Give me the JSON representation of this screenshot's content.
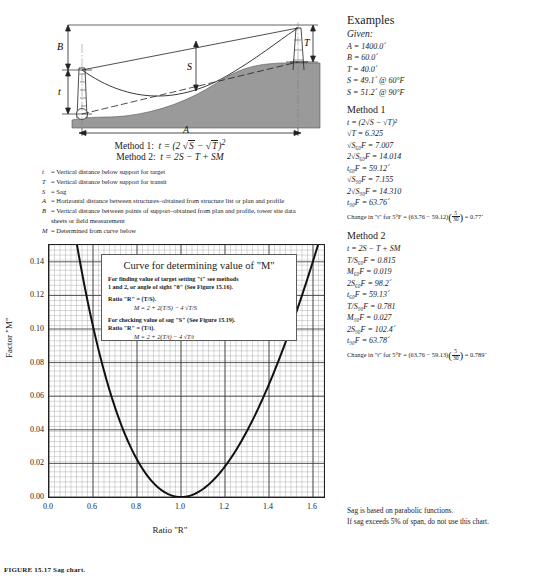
{
  "diagram": {
    "labels": {
      "B": "B",
      "T": "T",
      "S": "S",
      "t": "t",
      "A": "A"
    },
    "method1": "Method 1:  t = (2 √S − √T)²",
    "method2": "Method 2:  t = 2S − T + SM",
    "method1_label": "Method 1:",
    "method2_label": "Method 2:"
  },
  "definitions": [
    {
      "sym": "t",
      "text": "= Vertical distance below support for target"
    },
    {
      "sym": "T",
      "text": "= Vertical distance below support for transit"
    },
    {
      "sym": "S",
      "text": "= Sag"
    },
    {
      "sym": "A",
      "text": "= Horizontal distance between structures–obtained from structure list or plan and profile"
    },
    {
      "sym": "B",
      "text": "= Vertical distance between points of support–obtained from plan and profile, tower site data"
    },
    {
      "sym": "",
      "text": "sheets or field measurement"
    },
    {
      "sym": "M",
      "text": "= Determined from curve below"
    }
  ],
  "curve_box": {
    "title": "Curve for determining value of \"M\"",
    "line1": "For finding value of target setting \"t\" see methods",
    "line2": "1 and 2, or angle of sight \"θ\" (See Figure 15.16).",
    "ratio1": "Ratio \"R\" = (T/S).",
    "formula1": "M = 2 + 2(T/S) − 4 √T/S",
    "line3": "For checking value of sag \"S\"  (See Figure 15.19).",
    "ratio2": "Ratio \"R\" = (T/t).",
    "formula2": "M = 2 + 2(T/t) − 4 √T/t"
  },
  "chart_data": {
    "type": "line",
    "title": "Curve for determining value of \"M\"",
    "xlabel": "Ratio \"R\"",
    "ylabel": "Factor \"M\"",
    "xlim": [
      0.4,
      1.65
    ],
    "ylim": [
      0.0,
      0.15
    ],
    "xticks": [
      0.4,
      0.6,
      0.8,
      1.0,
      1.2,
      1.4,
      1.6
    ],
    "xticklabels": [
      "0.0",
      "0.6",
      "0.8",
      "1.0",
      "1.2",
      "1.4",
      "1.6"
    ],
    "yticks": [
      0.0,
      0.02,
      0.04,
      0.06,
      0.08,
      0.1,
      0.12,
      0.14
    ],
    "yticklabels": [
      "0.00",
      "0.02",
      "0.04",
      "0.06",
      "0.08",
      "0.10",
      "0.12",
      "0.14"
    ],
    "grid": true,
    "equation": "M = 2 + 2R - 4*sqrt(R)",
    "series": [
      {
        "name": "Factor M",
        "x": [
          0.45,
          0.5,
          0.55,
          0.6,
          0.65,
          0.7,
          0.75,
          0.8,
          0.85,
          0.9,
          0.95,
          1.0,
          1.05,
          1.1,
          1.15,
          1.2,
          1.25,
          1.3,
          1.35,
          1.4,
          1.45,
          1.5,
          1.55,
          1.6,
          1.65
        ],
        "y": [
          0.217,
          0.1716,
          0.1325,
          0.101,
          0.0754,
          0.0551,
          0.0359,
          0.0221,
          0.0113,
          0.0042,
          0.0006,
          0.0,
          0.0006,
          0.0024,
          0.0054,
          0.0092,
          0.0139,
          0.0194,
          0.0257,
          0.0325,
          0.04,
          0.0505,
          0.06,
          0.0702,
          0.0811
        ]
      }
    ]
  },
  "examples": {
    "heading": "Examples",
    "given_label": "Given:",
    "given": [
      "A = 1400.0´",
      "B = 60.0´",
      "T = 40.0´",
      "S = 49.1´ @ 60°F",
      "S = 51.2´ @ 90°F"
    ],
    "method1": {
      "heading": "Method 1",
      "formula": "t = (2√S − √T)²",
      "rows": [
        "√T = 6.325",
        "√S₆₀F = 7.007",
        "2√S₆₀F = 14.014",
        "t₆₀F = 59.12´",
        "√S₉₀F = 7.155",
        "2√S₉₀F = 14.310",
        "t₉₀F = 63.76´"
      ],
      "change_prefix": "Change in \"t\" for 5°F = (63.76 − 59.12)",
      "change_num": "5",
      "change_den": "30",
      "change_result": "= 0.77´"
    },
    "method2": {
      "heading": "Method 2",
      "formula": "t = 2S − T + SM",
      "rows": [
        "T/S₆₀F = 0.815",
        "M₆₀F = 0.019",
        "2S₆₀F = 98.2´",
        "t₆₀F = 59.13´",
        "T/S₉₀F = 0.781",
        "M₉₀F = 0.027",
        "2S₉₀F = 102.4´",
        "t₉₀F = 63.78´"
      ],
      "change_prefix": "Change in \"t\" for 5°F = (63.76 − 59.13)",
      "change_num": "5",
      "change_den": "30",
      "change_result": "= 0.789´"
    }
  },
  "sag_note": {
    "line1": "Sag is based on parabolic functions.",
    "line2": "If sag exceeds 5% of span, do not use this chart."
  },
  "figure_caption": "FIGURE 15.17   Sag chart.",
  "colors": {
    "ground_fill": "#9a9a9a",
    "line": "#1a1a1a",
    "grid": "#8f8f8f"
  }
}
